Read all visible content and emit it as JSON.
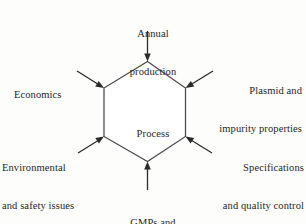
{
  "diagram": {
    "type": "hexagon-influence-diagram",
    "center": {
      "label": "Process",
      "shape": "hexagon"
    },
    "colors": {
      "background": "#fdfdfc",
      "hexagon_stroke": "#4a4a4a",
      "hexagon_fill": "#ffffff",
      "arrow": "#2b2b2b",
      "text": "#1f1f1f"
    },
    "inputs": [
      {
        "id": "annual-production",
        "line1": "Annual",
        "line2": "production",
        "position": "top",
        "arrow_direction": "down"
      },
      {
        "id": "economics",
        "line1": "Economics",
        "line2": "",
        "position": "upper-left",
        "arrow_direction": "down-right"
      },
      {
        "id": "plasmid-and-impurity-properties",
        "line1": "Plasmid and",
        "line2": "impurity properties",
        "position": "upper-right",
        "arrow_direction": "down-left"
      },
      {
        "id": "environmental-and-safety-issues",
        "line1": "Environmental",
        "line2": "and safety issues",
        "position": "lower-left",
        "arrow_direction": "up-right"
      },
      {
        "id": "specifications-and-quality-control",
        "line1": "Specifications",
        "line2": "and quality control",
        "position": "lower-right",
        "arrow_direction": "up-left"
      },
      {
        "id": "gmps-and-validation",
        "line1": "GMPs and",
        "line2": "validation",
        "position": "bottom",
        "arrow_direction": "up"
      }
    ]
  }
}
